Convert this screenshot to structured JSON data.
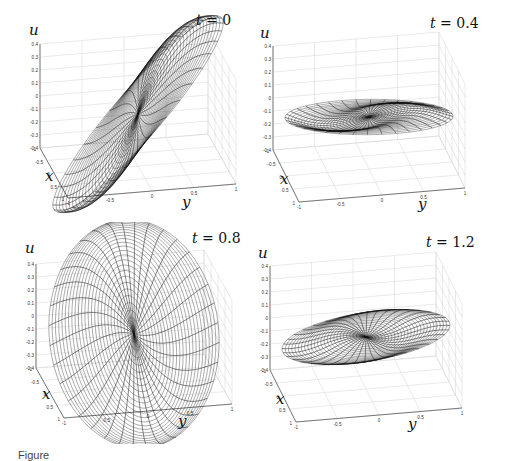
{
  "figure": {
    "caption_fragment": "Figure",
    "panels": [
      {
        "title_var": "t",
        "title_value": "0",
        "chart_data": {
          "type": "surface",
          "title": "t = 0",
          "xlabel": "x",
          "ylabel": "y",
          "zlabel": "u",
          "xlim": [
            -1,
            1
          ],
          "ylim": [
            -1,
            1
          ],
          "zlim": [
            -0.4,
            0.4
          ],
          "xticks": [
            "-1",
            "-0.5",
            "0",
            "0.5",
            "1"
          ],
          "yticks": [
            "-1",
            "-0.5",
            "0",
            "0.5",
            "1"
          ],
          "zticks": [
            "-0.4",
            "-0.3",
            "-0.2",
            "-0.1",
            "0",
            "0.1",
            "0.2",
            "0.3",
            "0.4"
          ],
          "grid": true,
          "domain": "unit disk (polar mesh)",
          "surface": {
            "amplitude": 0.38,
            "phase_deg": 20,
            "twist": 0.4
          }
        }
      },
      {
        "title_var": "t",
        "title_value": "0.4",
        "chart_data": {
          "type": "surface",
          "title": "t = 0.4",
          "xlabel": "x",
          "ylabel": "y",
          "zlabel": "u",
          "xlim": [
            -1,
            1
          ],
          "ylim": [
            -1,
            1
          ],
          "zlim": [
            -0.4,
            0.4
          ],
          "xticks": [
            "-1",
            "-0.5",
            "0",
            "0.5",
            "1"
          ],
          "yticks": [
            "-1",
            "-0.5",
            "0",
            "0.5",
            "1"
          ],
          "zticks": [
            "-0.4",
            "-0.3",
            "-0.2",
            "-0.1",
            "0",
            "0.1",
            "0.2",
            "0.3",
            "0.4"
          ],
          "grid": true,
          "domain": "unit disk (polar mesh)",
          "surface": {
            "amplitude": 0.04,
            "phase_deg": 60,
            "twist": 3.0
          }
        }
      },
      {
        "title_var": "t",
        "title_value": "0.8",
        "chart_data": {
          "type": "surface",
          "title": "t = 0.8",
          "xlabel": "x",
          "ylabel": "y",
          "zlabel": "u",
          "xlim": [
            -1,
            1
          ],
          "ylim": [
            -1,
            1
          ],
          "zlim": [
            -0.4,
            0.4
          ],
          "xticks": [
            "-1",
            "-0.5",
            "0",
            "0.5",
            "1"
          ],
          "yticks": [
            "-1",
            "-0.5",
            "0",
            "0.5",
            "1"
          ],
          "zticks": [
            "-0.4",
            "-0.3",
            "-0.2",
            "-0.1",
            "0",
            "0.1",
            "0.2",
            "0.3",
            "0.4"
          ],
          "grid": true,
          "domain": "unit disk (polar mesh)",
          "surface": {
            "amplitude": 0.38,
            "phase_deg": 110,
            "twist": 0.4
          }
        }
      },
      {
        "title_var": "t",
        "title_value": "1.2",
        "chart_data": {
          "type": "surface",
          "title": "t = 1.2",
          "xlabel": "x",
          "ylabel": "y",
          "zlabel": "u",
          "xlim": [
            -1,
            1
          ],
          "ylim": [
            -1,
            1
          ],
          "zlim": [
            -0.4,
            0.4
          ],
          "xticks": [
            "-1",
            "-0.5",
            "0",
            "0.5",
            "1"
          ],
          "yticks": [
            "-1",
            "-0.5",
            "0",
            "0.5",
            "1"
          ],
          "zticks": [
            "-0.4",
            "-0.3",
            "-0.2",
            "-0.1",
            "0",
            "0.1",
            "0.2",
            "0.3",
            "0.4"
          ],
          "grid": true,
          "domain": "unit disk (polar mesh)",
          "surface": {
            "amplitude": 0.04,
            "phase_deg": 150,
            "twist": 3.0
          }
        }
      }
    ]
  },
  "chart_data": [
    {
      "type": "surface",
      "title": "t = 0",
      "xlabel": "x",
      "ylabel": "y",
      "zlabel": "u",
      "xlim": [
        -1,
        1
      ],
      "ylim": [
        -1,
        1
      ],
      "zlim": [
        -0.4,
        0.4
      ],
      "grid": true
    },
    {
      "type": "surface",
      "title": "t = 0.4",
      "xlabel": "x",
      "ylabel": "y",
      "zlabel": "u",
      "xlim": [
        -1,
        1
      ],
      "ylim": [
        -1,
        1
      ],
      "zlim": [
        -0.4,
        0.4
      ],
      "grid": true
    },
    {
      "type": "surface",
      "title": "t = 0.8",
      "xlabel": "x",
      "ylabel": "y",
      "zlabel": "u",
      "xlim": [
        -1,
        1
      ],
      "ylim": [
        -1,
        1
      ],
      "zlim": [
        -0.4,
        0.4
      ],
      "grid": true
    },
    {
      "type": "surface",
      "title": "t = 1.2",
      "xlabel": "x",
      "ylabel": "y",
      "zlabel": "u",
      "xlim": [
        -1,
        1
      ],
      "ylim": [
        -1,
        1
      ],
      "zlim": [
        -0.4,
        0.4
      ],
      "grid": true
    }
  ]
}
